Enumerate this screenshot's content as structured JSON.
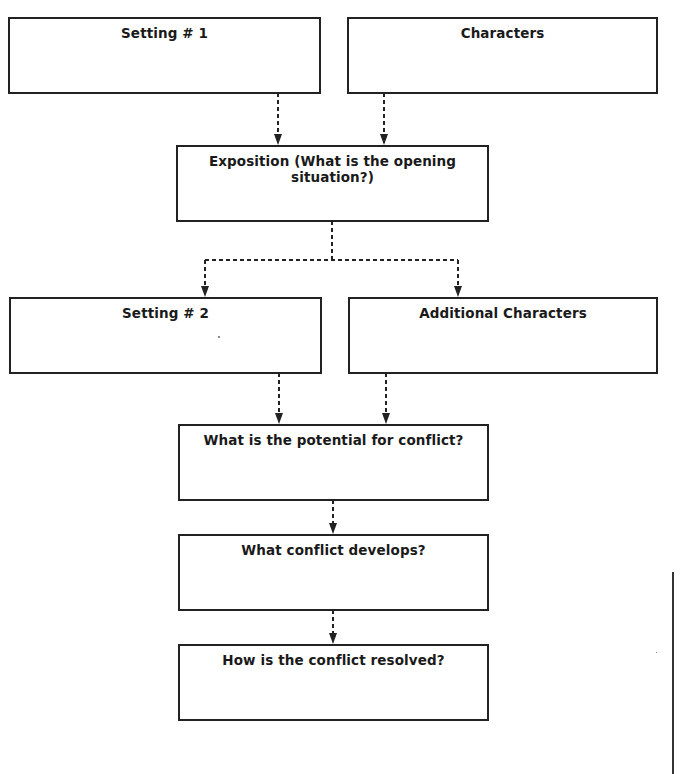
{
  "diagram": {
    "type": "story-map-flowchart",
    "boxes": [
      {
        "id": "setting1",
        "label": "Setting # 1"
      },
      {
        "id": "characters",
        "label": "Characters"
      },
      {
        "id": "exposition",
        "label": "Exposition (What is the opening situation?)"
      },
      {
        "id": "setting2",
        "label": "Setting # 2"
      },
      {
        "id": "additional_characters",
        "label": "Additional Characters"
      },
      {
        "id": "potential_conflict",
        "label": "What is the potential for conflict?"
      },
      {
        "id": "conflict_develops",
        "label": "What conflict develops?"
      },
      {
        "id": "conflict_resolved",
        "label": "How is the conflict resolved?"
      }
    ],
    "edges": [
      {
        "from": "setting1",
        "to": "exposition",
        "style": "dashed-arrow"
      },
      {
        "from": "characters",
        "to": "exposition",
        "style": "dashed-arrow"
      },
      {
        "from": "exposition",
        "to": "setting2",
        "style": "dashed-arrow"
      },
      {
        "from": "exposition",
        "to": "additional_characters",
        "style": "dashed-arrow"
      },
      {
        "from": "setting2",
        "to": "potential_conflict",
        "style": "dashed-arrow"
      },
      {
        "from": "additional_characters",
        "to": "potential_conflict",
        "style": "dashed-arrow"
      },
      {
        "from": "potential_conflict",
        "to": "conflict_develops",
        "style": "dashed-arrow"
      },
      {
        "from": "conflict_develops",
        "to": "conflict_resolved",
        "style": "dashed-arrow"
      }
    ],
    "colors": {
      "line": "#222222",
      "background": "#ffffff",
      "text": "#1a1a1a"
    }
  }
}
